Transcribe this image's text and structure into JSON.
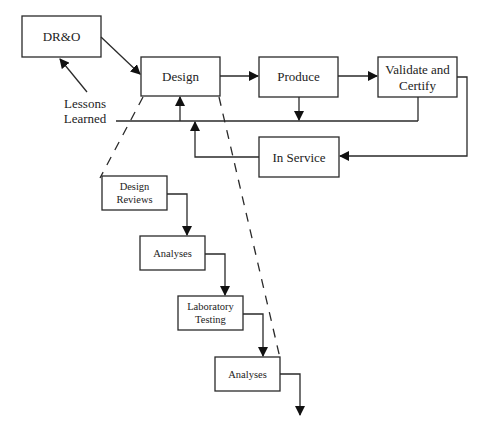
{
  "diagram": {
    "nodes": {
      "dro": {
        "label": "DR&O"
      },
      "design": {
        "label": "Design"
      },
      "produce": {
        "label": "Produce"
      },
      "validate": {
        "line1": "Validate and",
        "line2": "Certify"
      },
      "in_service": {
        "label": "In Service"
      },
      "lessons": {
        "line1": "Lessons",
        "line2": "Learned"
      },
      "design_reviews": {
        "line1": "Design",
        "line2": "Reviews"
      },
      "analyses_1": {
        "label": "Analyses"
      },
      "lab_testing": {
        "line1": "Laboratory",
        "line2": "Testing"
      },
      "analyses_2": {
        "label": "Analyses"
      }
    },
    "edges": [
      {
        "from": "DR&O",
        "to": "Design"
      },
      {
        "from": "Design",
        "to": "Produce"
      },
      {
        "from": "Produce",
        "to": "Validate and Certify"
      },
      {
        "from": "Produce",
        "to": "Lessons Learned feedback line"
      },
      {
        "from": "Validate and Certify",
        "to": "Lessons Learned feedback line"
      },
      {
        "from": "Validate and Certify",
        "to": "In Service"
      },
      {
        "from": "In Service",
        "to": "Lessons Learned feedback line"
      },
      {
        "from": "Lessons Learned feedback line",
        "to": "Design"
      },
      {
        "from": "Lessons Learned",
        "to": "DR&O"
      },
      {
        "from": "Design Reviews",
        "to": "Analyses"
      },
      {
        "from": "Analyses",
        "to": "Laboratory Testing"
      },
      {
        "from": "Laboratory Testing",
        "to": "Analyses"
      },
      {
        "from": "Analyses",
        "to": "continuation"
      }
    ]
  }
}
